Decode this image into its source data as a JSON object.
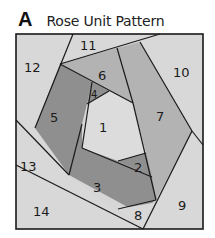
{
  "header": {
    "letter": "A",
    "title": "Rose Unit Pattern"
  },
  "colors": {
    "light": "#d6d6d6",
    "medium": "#b3b3b3",
    "dark": "#8f8f8f",
    "center": "#dcdcdc",
    "line": "#1a1a1a"
  },
  "pieces": [
    {
      "id": "1",
      "label": "1",
      "shade": "light"
    },
    {
      "id": "2",
      "label": "2",
      "shade": "dark"
    },
    {
      "id": "3",
      "label": "3",
      "shade": "dark"
    },
    {
      "id": "4",
      "label": "4",
      "shade": "dark"
    },
    {
      "id": "5",
      "label": "5",
      "shade": "dark"
    },
    {
      "id": "6",
      "label": "6",
      "shade": "medium"
    },
    {
      "id": "7",
      "label": "7",
      "shade": "medium"
    },
    {
      "id": "8",
      "label": "8",
      "shade": "light"
    },
    {
      "id": "9",
      "label": "9",
      "shade": "light"
    },
    {
      "id": "10",
      "label": "10",
      "shade": "light"
    },
    {
      "id": "11",
      "label": "11",
      "shade": "light"
    },
    {
      "id": "12",
      "label": "12",
      "shade": "light"
    },
    {
      "id": "13",
      "label": "13",
      "shade": "light"
    },
    {
      "id": "14",
      "label": "14",
      "shade": "light"
    }
  ]
}
